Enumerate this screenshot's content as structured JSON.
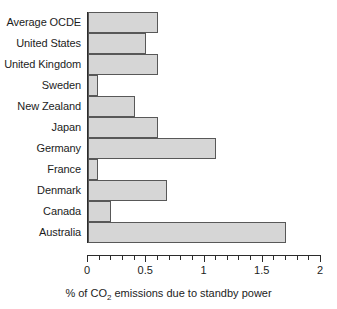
{
  "chart_data": {
    "type": "bar",
    "orientation": "horizontal",
    "title": "",
    "xlabel": "% of CO2 emissions due to standby power",
    "xlabel_parts": {
      "pre": "% of CO",
      "sub": "2",
      "post": " emissions due to standby power"
    },
    "ylabel": "",
    "xlim": [
      0,
      2
    ],
    "xticks": [
      0,
      0.5,
      1,
      1.5,
      2
    ],
    "xtick_labels": [
      "0",
      "0.5",
      "1",
      "1.5",
      "2"
    ],
    "minor_tick_step": 0.1,
    "grid": false,
    "legend": null,
    "bar_fill_color": "#d6d6d6",
    "bar_edge_color": "#585858",
    "axis_color": "#2b2b2b",
    "categories": [
      "Average OCDE",
      "United States",
      "United Kingdom",
      "Sweden",
      "New Zealand",
      "Japan",
      "Germany",
      "France",
      "Denmark",
      "Canada",
      "Australia"
    ],
    "values": [
      0.6,
      0.5,
      0.6,
      0.09,
      0.4,
      0.6,
      1.1,
      0.09,
      0.68,
      0.2,
      1.7
    ]
  }
}
